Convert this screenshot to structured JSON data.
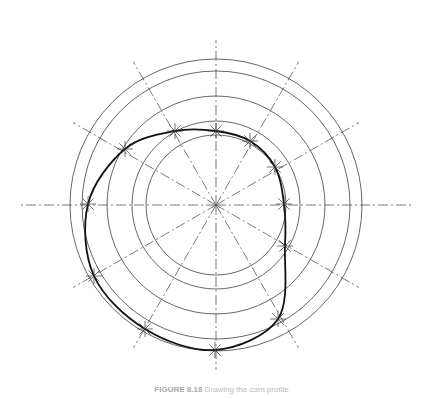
{
  "figure": {
    "caption_label": "FIGURE 8.18",
    "caption_text": " Drawing the cam profile",
    "center": [
      216,
      205
    ],
    "circle_radii": [
      146,
      134,
      109,
      84,
      70
    ],
    "ray_angles_deg": [
      0,
      30,
      60,
      90,
      120,
      150,
      180,
      210,
      240,
      270,
      300,
      330
    ],
    "ray_length": 195,
    "profile_points": [
      [
        216,
        131
      ],
      [
        250,
        141
      ],
      [
        275,
        167
      ],
      [
        284,
        204
      ],
      [
        285,
        246
      ],
      [
        278,
        319
      ],
      [
        215,
        350
      ],
      [
        145,
        329
      ],
      [
        94,
        276
      ],
      [
        88,
        204
      ],
      [
        125,
        149
      ],
      [
        175,
        131
      ]
    ],
    "colors": {
      "lines": "#555555",
      "profile": "#111111"
    }
  }
}
